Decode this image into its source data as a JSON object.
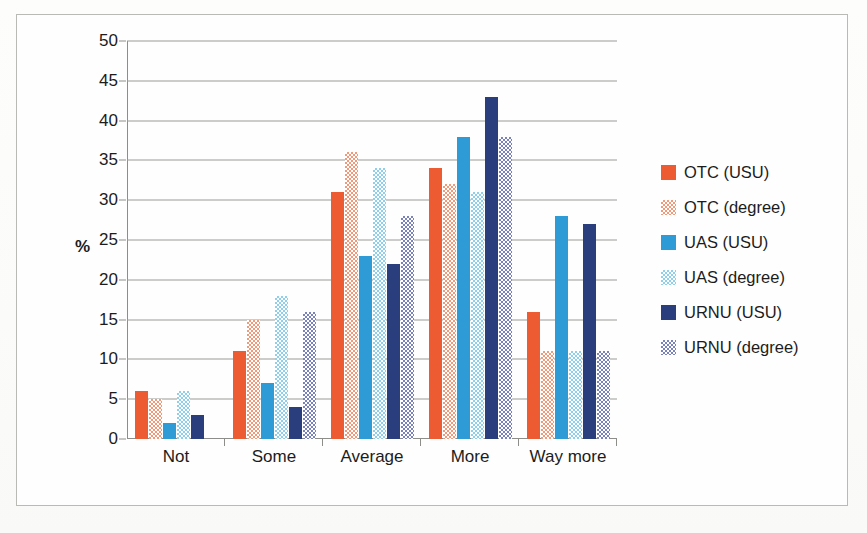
{
  "chart_data": {
    "type": "bar",
    "title": "",
    "xlabel": "",
    "ylabel": "%",
    "ylim": [
      0,
      50
    ],
    "ytick_step": 5,
    "yticks": [
      50,
      45,
      40,
      35,
      30,
      25,
      20,
      15,
      10,
      5,
      0
    ],
    "grid": true,
    "legend_position": "right",
    "categories": [
      "Not",
      "Some",
      "Average",
      "More",
      "Way more"
    ],
    "series": [
      {
        "name": "OTC (USU)",
        "color": "#ED5B33",
        "fill": "solid",
        "values": [
          6,
          11,
          31,
          34,
          16
        ]
      },
      {
        "name": "OTC (degree)",
        "color": "#F2997A",
        "fill": "dotted",
        "values": [
          5,
          15,
          36,
          32,
          11
        ]
      },
      {
        "name": "UAS (USU)",
        "color": "#2E9BD6",
        "fill": "solid",
        "values": [
          2,
          7,
          23,
          38,
          28
        ]
      },
      {
        "name": "UAS (degree)",
        "color": "#8ED0EC",
        "fill": "dotted",
        "values": [
          6,
          18,
          34,
          31,
          11
        ]
      },
      {
        "name": "URNU (USU)",
        "color": "#2A3D7C",
        "fill": "solid",
        "values": [
          3,
          4,
          22,
          43,
          27
        ]
      },
      {
        "name": "URNU (degree)",
        "color": "#7A82BE",
        "fill": "dotted",
        "values": [
          0,
          16,
          28,
          38,
          11
        ]
      }
    ]
  },
  "legend": {
    "items": [
      {
        "label": "OTC (USU)"
      },
      {
        "label": "OTC (degree)"
      },
      {
        "label": "UAS (USU)"
      },
      {
        "label": "UAS (degree)"
      },
      {
        "label": "URNU (USU)"
      },
      {
        "label": "URNU (degree)"
      }
    ]
  },
  "caption": {
    "text": ""
  }
}
